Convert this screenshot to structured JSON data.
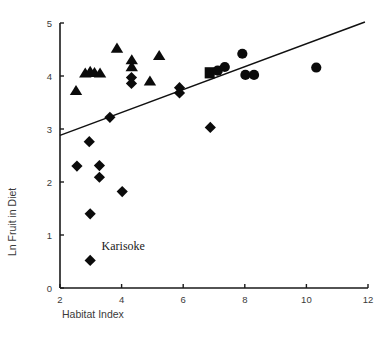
{
  "chart_data": {
    "type": "scatter",
    "title": "",
    "xlabel": "Habitat Index",
    "ylabel": "Ln Fruit in Diet",
    "xlim": [
      2,
      12
    ],
    "ylim": [
      0,
      5
    ],
    "xticks": [
      2,
      4,
      6,
      8,
      10,
      12
    ],
    "yticks": [
      0,
      1,
      2,
      3,
      4,
      5
    ],
    "xtick_labels": [
      "2",
      "4",
      "6",
      "8",
      "10",
      "12"
    ],
    "ytick_labels": [
      "0",
      "1",
      "2",
      "3",
      "4",
      "5"
    ],
    "grid": false,
    "legend": "none",
    "annotations": [
      {
        "text": "Karisoke",
        "x": 3.35,
        "y": 0.72
      }
    ],
    "trendline": {
      "type": "linear",
      "x_start": 2.0,
      "y_start": 2.88,
      "x_end": 11.9,
      "y_end": 5.02
    },
    "series": [
      {
        "name": "triangle-series",
        "marker": "triangle",
        "points": [
          {
            "x": 2.52,
            "y": 3.72
          },
          {
            "x": 2.82,
            "y": 4.05
          },
          {
            "x": 2.98,
            "y": 4.08
          },
          {
            "x": 3.12,
            "y": 4.06
          },
          {
            "x": 3.3,
            "y": 4.05
          },
          {
            "x": 3.85,
            "y": 4.52
          },
          {
            "x": 4.33,
            "y": 4.3
          },
          {
            "x": 4.33,
            "y": 4.17
          },
          {
            "x": 4.92,
            "y": 3.9
          },
          {
            "x": 5.22,
            "y": 4.38
          }
        ]
      },
      {
        "name": "diamond-series",
        "marker": "diamond",
        "points": [
          {
            "x": 2.55,
            "y": 2.3
          },
          {
            "x": 2.95,
            "y": 2.76
          },
          {
            "x": 2.98,
            "y": 1.4
          },
          {
            "x": 2.98,
            "y": 0.52
          },
          {
            "x": 3.28,
            "y": 2.31
          },
          {
            "x": 3.28,
            "y": 2.09
          },
          {
            "x": 3.62,
            "y": 3.22
          },
          {
            "x": 4.02,
            "y": 1.82
          },
          {
            "x": 4.32,
            "y": 3.97
          },
          {
            "x": 4.32,
            "y": 3.86
          },
          {
            "x": 5.88,
            "y": 3.78
          },
          {
            "x": 5.88,
            "y": 3.68
          },
          {
            "x": 6.88,
            "y": 3.03
          }
        ]
      },
      {
        "name": "square-series",
        "marker": "square",
        "points": [
          {
            "x": 6.86,
            "y": 4.06
          }
        ]
      },
      {
        "name": "circle-series",
        "marker": "circle",
        "points": [
          {
            "x": 7.12,
            "y": 4.1
          },
          {
            "x": 7.35,
            "y": 4.17
          },
          {
            "x": 7.92,
            "y": 4.42
          },
          {
            "x": 8.02,
            "y": 4.02
          },
          {
            "x": 8.3,
            "y": 4.02
          },
          {
            "x": 10.32,
            "y": 4.16
          }
        ]
      }
    ]
  },
  "axes": {
    "y_axis_title": "Ln Fruit in Diet",
    "x_axis_title": "Habitat Index"
  }
}
